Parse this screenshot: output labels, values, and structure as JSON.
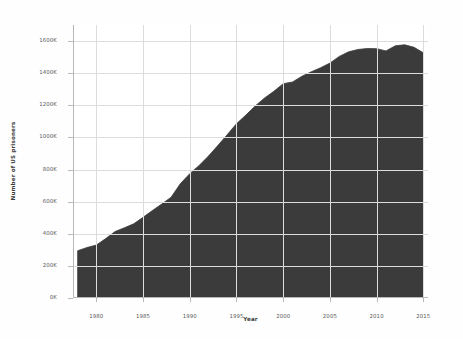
{
  "chart_data": {
    "type": "area",
    "title": "",
    "xlabel": "Year",
    "ylabel": "Number of US prisoners",
    "xlim": [
      1977.5,
      2015.5
    ],
    "ylim": [
      0,
      1700000
    ],
    "grid": true,
    "legend": "none",
    "fill_color": "#3b3b3b",
    "line_color": "#3b3b3b",
    "background_color": "#ffffff",
    "grid_color": "#dcdcdc",
    "x_ticks": [
      1980,
      1985,
      1990,
      1995,
      2000,
      2005,
      2010,
      2015
    ],
    "x_tick_labels": [
      "1980",
      "1985",
      "1990",
      "1995",
      "2000",
      "2005",
      "2010",
      "2015"
    ],
    "y_ticks": [
      0,
      200000,
      400000,
      600000,
      800000,
      1000000,
      1200000,
      1400000,
      1600000
    ],
    "y_tick_labels": [
      "0K",
      "200K",
      "400K",
      "600K",
      "800K",
      "1000K",
      "1200K",
      "1400K",
      "1600K"
    ],
    "x": [
      1978,
      1979,
      1980,
      1981,
      1982,
      1983,
      1984,
      1985,
      1986,
      1987,
      1988,
      1989,
      1990,
      1991,
      1992,
      1993,
      1994,
      1995,
      1996,
      1997,
      1998,
      1999,
      2000,
      2001,
      2002,
      2003,
      2004,
      2005,
      2006,
      2007,
      2008,
      2009,
      2010,
      2011,
      2012,
      2013,
      2014,
      2015
    ],
    "values": [
      294400,
      314500,
      329800,
      369900,
      413800,
      437200,
      462000,
      502500,
      544900,
      585100,
      627600,
      712400,
      774400,
      825600,
      883600,
      949000,
      1016700,
      1085400,
      1138900,
      1195500,
      1245000,
      1287200,
      1334500,
      1345200,
      1380500,
      1408400,
      1433800,
      1462900,
      1504600,
      1532900,
      1547700,
      1553600,
      1552700,
      1538800,
      1570400,
      1576900,
      1561500,
      1526800
    ],
    "series_name": "US prison population",
    "units": "prisoners"
  },
  "axes": {
    "x_title": "Year",
    "y_title": "Number of US prisoners"
  }
}
